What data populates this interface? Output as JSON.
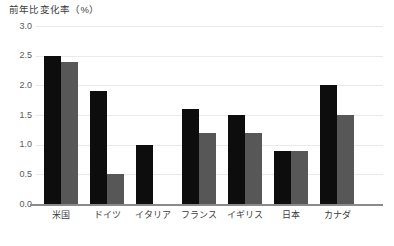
{
  "chart_data": {
    "type": "bar",
    "title": "前年比変化率（%）",
    "xlabel": "",
    "ylabel": "前年比変化率（%）",
    "ylim": [
      0.0,
      3.0
    ],
    "ytick_labels": [
      "0.0",
      "0.5",
      "1.0",
      "1.5",
      "2.0",
      "2.5",
      "3.0"
    ],
    "ytick_values": [
      0.0,
      0.5,
      1.0,
      1.5,
      2.0,
      2.5,
      3.0
    ],
    "grid": true,
    "legend_position": "none",
    "categories": [
      "米国",
      "ドイツ",
      "イタリア",
      "フランス",
      "イギリス",
      "日本",
      "カナダ"
    ],
    "series": [
      {
        "name": "series-dark",
        "color": "#0d0d0d",
        "values": [
          2.5,
          1.9,
          1.0,
          1.6,
          1.5,
          0.9,
          2.0
        ]
      },
      {
        "name": "series-light",
        "color": "#575757",
        "values": [
          2.4,
          0.5,
          0.0,
          1.2,
          1.2,
          0.9,
          1.5
        ]
      }
    ]
  },
  "colors": {
    "dark_bar": "#0d0d0d",
    "light_bar": "#575757",
    "gridline": "#e9e9e9",
    "axis": "#8a8a8a",
    "text": "#3c3c3c",
    "background": "#ffffff"
  }
}
